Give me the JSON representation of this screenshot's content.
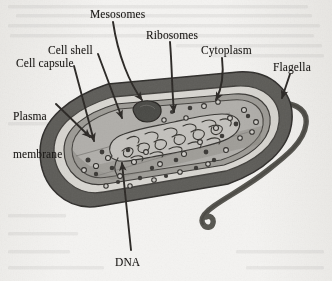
{
  "figure": {
    "background_color": "#f4f3f1",
    "ink_color": "#161412"
  },
  "labels": [
    {
      "id": "mesosomes",
      "text": "Mesosomes",
      "x": 90,
      "y": 8,
      "lines": [
        "Mesosomes"
      ]
    },
    {
      "id": "ribosomes",
      "text": "Ribosomes",
      "x": 146,
      "y": 29,
      "lines": [
        "Ribosomes"
      ]
    },
    {
      "id": "cytoplasm",
      "text": "Cytoplasm",
      "x": 201,
      "y": 44,
      "lines": [
        "Cytoplasm"
      ]
    },
    {
      "id": "flagella",
      "text": "Flagella",
      "x": 273,
      "y": 61,
      "lines": [
        "Flagella"
      ]
    },
    {
      "id": "cell-shell",
      "text": "Cell shell",
      "x": 48,
      "y": 44,
      "lines": [
        "Cell shell"
      ]
    },
    {
      "id": "cell-capsule",
      "text": "Cell capsule",
      "x": 16,
      "y": 57,
      "lines": [
        "Cell capsule"
      ]
    },
    {
      "id": "plasma-membrane",
      "text": "Plasma membrane",
      "x": 13,
      "y": 85,
      "lines": [
        "Plasma",
        "membrane"
      ]
    },
    {
      "id": "dna",
      "text": "DNA",
      "x": 115,
      "y": 256,
      "lines": [
        "DNA"
      ]
    }
  ],
  "structures": {
    "capsule": {
      "name": "Cell capsule",
      "color": "#5d5b58"
    },
    "shell": {
      "name": "Cell shell",
      "color": "#d8d6d1"
    },
    "membrane": {
      "name": "Plasma membrane",
      "color": "#9d9b96"
    },
    "cytoplasm": {
      "name": "Cytoplasm",
      "color": "#b0aeaa"
    },
    "mesosome": {
      "name": "Mesosome",
      "color": "#4a4845"
    },
    "nucleoid": {
      "name": "DNA nucleoid",
      "color": "#c3c1bd"
    },
    "flagellum": {
      "name": "Flagellum",
      "color": "#56544f"
    },
    "ribosome": {
      "name": "Ribosome",
      "color": "#3a3835"
    }
  },
  "leaders": [
    {
      "id": "leader-mesosomes",
      "from_label": "mesosomes",
      "to_structure": "mesosome"
    },
    {
      "id": "leader-ribosomes",
      "from_label": "ribosomes",
      "to_structure": "ribosome"
    },
    {
      "id": "leader-cytoplasm",
      "from_label": "cytoplasm",
      "to_structure": "cytoplasm"
    },
    {
      "id": "leader-flagella",
      "from_label": "flagella",
      "to_structure": "flagellum"
    },
    {
      "id": "leader-cell-shell",
      "from_label": "cell-shell",
      "to_structure": "shell"
    },
    {
      "id": "leader-cell-capsule",
      "from_label": "cell-capsule",
      "to_structure": "capsule"
    },
    {
      "id": "leader-plasma",
      "from_label": "plasma-membrane",
      "to_structure": "membrane"
    },
    {
      "id": "leader-dna",
      "from_label": "dna",
      "to_structure": "nucleoid"
    }
  ]
}
